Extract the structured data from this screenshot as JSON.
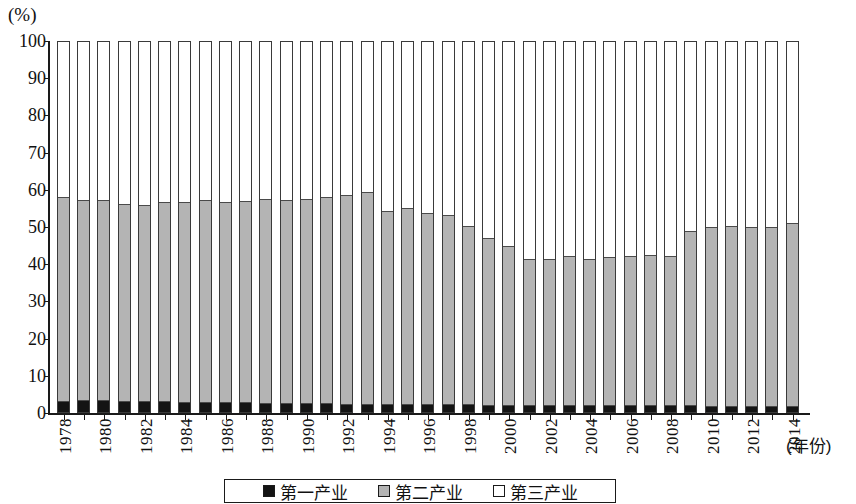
{
  "chart_data": {
    "type": "bar",
    "stacked": true,
    "stack_mode": "percent",
    "title": "",
    "subtitle": "",
    "unit_label": "(%)",
    "xlabel": "(年份)",
    "ylabel": "",
    "ylim": [
      0,
      100
    ],
    "ytick_labels": [
      "0",
      "10",
      "20",
      "30",
      "40",
      "50",
      "60",
      "70",
      "80",
      "90",
      "100"
    ],
    "ytick_values": [
      0,
      10,
      20,
      30,
      40,
      50,
      60,
      70,
      80,
      90,
      100
    ],
    "grid": false,
    "legend_position": "bottom",
    "categories": [
      "1978",
      "1979",
      "1980",
      "1981",
      "1982",
      "1983",
      "1984",
      "1985",
      "1986",
      "1987",
      "1988",
      "1989",
      "1990",
      "1991",
      "1992",
      "1993",
      "1994",
      "1995",
      "1996",
      "1997",
      "1998",
      "1999",
      "2000",
      "2001",
      "2002",
      "2003",
      "2004",
      "2005",
      "2006",
      "2007",
      "2008",
      "2009",
      "2010",
      "2011",
      "2012",
      "2013",
      "2014"
    ],
    "xtick_labels": [
      "1978",
      "",
      "1980",
      "",
      "1982",
      "",
      "1984",
      "",
      "1986",
      "",
      "1988",
      "",
      "1990",
      "",
      "1992",
      "",
      "1994",
      "",
      "1996",
      "",
      "1998",
      "",
      "2000",
      "",
      "2002",
      "",
      "2004",
      "",
      "2006",
      "",
      "2008",
      "",
      "2010",
      "",
      "2012",
      "",
      "2014"
    ],
    "series": [
      {
        "name": "第一产业",
        "color": "#141414",
        "values": [
          2.8,
          3.0,
          3.0,
          2.8,
          2.6,
          2.6,
          2.5,
          2.4,
          2.4,
          2.3,
          2.2,
          2.2,
          2.2,
          2.1,
          2.0,
          2.0,
          2.0,
          2.0,
          1.9,
          1.9,
          1.8,
          1.7,
          1.7,
          1.7,
          1.6,
          1.6,
          1.6,
          1.6,
          1.5,
          1.5,
          1.5,
          1.5,
          1.4,
          1.4,
          1.4,
          1.4,
          1.3
        ]
      },
      {
        "name": "第二产业",
        "color": "#b4b4b4",
        "values": [
          54.4,
          53.5,
          53.4,
          52.6,
          52.5,
          53.3,
          53.5,
          54.0,
          53.6,
          53.9,
          54.4,
          54.3,
          54.5,
          55.1,
          55.8,
          56.6,
          51.6,
          52.2,
          51.1,
          50.6,
          47.6,
          44.5,
          42.4,
          38.9,
          38.9,
          39.8,
          39.0,
          39.6,
          40.0,
          40.2,
          39.9,
          46.7,
          47.9,
          48.2,
          47.8,
          47.9,
          49.1
        ]
      },
      {
        "name": "第三产业",
        "color": "#ffffff",
        "values": [
          42.8,
          43.5,
          43.6,
          44.6,
          44.9,
          44.1,
          44.0,
          43.6,
          44.0,
          43.8,
          43.4,
          43.5,
          43.3,
          42.8,
          42.2,
          41.4,
          46.4,
          45.8,
          47.0,
          47.5,
          50.6,
          53.8,
          55.9,
          59.4,
          59.5,
          58.6,
          59.4,
          58.8,
          58.5,
          58.3,
          58.6,
          51.8,
          50.7,
          50.4,
          50.8,
          50.7,
          49.6
        ]
      }
    ],
    "stack_tops": {
      "description": "cumulative top of 第一产业 + 第二产业 per year (%)",
      "values": [
        57.2,
        56.5,
        56.4,
        55.4,
        55.1,
        55.9,
        56.0,
        56.4,
        56.0,
        56.2,
        56.6,
        56.5,
        56.7,
        57.2,
        57.8,
        58.6,
        53.6,
        54.2,
        53.0,
        52.5,
        49.4,
        46.2,
        44.1,
        40.6,
        40.5,
        41.4,
        40.6,
        41.2,
        41.5,
        41.7,
        41.4,
        48.2,
        49.3,
        49.6,
        49.2,
        49.3,
        50.4
      ]
    }
  },
  "legend": {
    "items": [
      {
        "label": "第一产业",
        "swatch": "black-swatch"
      },
      {
        "label": "第二产业",
        "swatch": "gray-swatch"
      },
      {
        "label": "第三产业",
        "swatch": "white-swatch"
      }
    ]
  }
}
